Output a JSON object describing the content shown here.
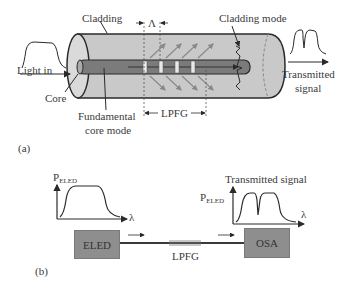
{
  "figure_a": {
    "panel_label": "(a)",
    "labels": {
      "cladding": "Cladding",
      "period": "Λ",
      "cladding_mode": "Cladding mode",
      "light_in": "Light in",
      "core": "Core",
      "fundamental_core_mode_line1": "Fundamental",
      "fundamental_core_mode_line2": "core mode",
      "lpfg": "LPFG",
      "transmitted_line1": "Transmitted",
      "transmitted_line2": "signal"
    }
  },
  "figure_b": {
    "panel_label": "(b)",
    "source": {
      "label": "ELED",
      "axis_y": "P",
      "axis_y_sub": "ELED",
      "axis_x": "λ"
    },
    "analyzer": {
      "label": "OSA",
      "title": "Transmitted signal",
      "axis_y": "P",
      "axis_y_sub": "ELED",
      "axis_x": "λ"
    },
    "fiber_label": "LPFG"
  },
  "colors": {
    "cladding_fill": "#c8c8c8",
    "core_fill": "#7a7a7a",
    "box_fill": "#8e8e8e",
    "line": "#2a2a2a"
  }
}
